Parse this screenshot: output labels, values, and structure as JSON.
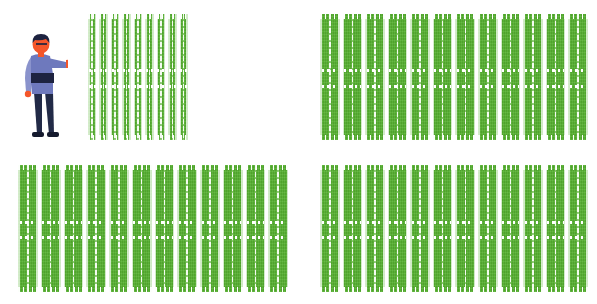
{
  "scene": {
    "title": "Array of football fields with a person for scale",
    "background_color": "#ffffff",
    "width": 597,
    "height": 304
  },
  "palette": {
    "field_green": "#55b02f",
    "field_green_dark": "#3f8f22",
    "line_white": "#f7fdf4",
    "skin": "#f4562a",
    "hair": "#1d2340",
    "shirt": "#6e79bd",
    "shirt_band": "#1d2340",
    "sleeve": "#8a93cc",
    "trousers": "#222a47",
    "shoes": "#151a2e"
  },
  "person": {
    "name": "person-figure",
    "pose": "standing, right arm extended pointing toward the fields",
    "caption": ""
  },
  "field_blocks": [
    {
      "name": "field-block-top-left",
      "position": "top-left",
      "strip_count": 9,
      "left": 88,
      "top": 14,
      "width": 100,
      "height": 126
    },
    {
      "name": "field-block-top-right",
      "position": "top-right",
      "strip_count": 12,
      "left": 320,
      "top": 14,
      "width": 268,
      "height": 126
    },
    {
      "name": "field-block-bottom-left",
      "position": "bottom-left",
      "strip_count": 12,
      "left": 18,
      "top": 165,
      "width": 270,
      "height": 127
    },
    {
      "name": "field-block-bottom-right",
      "position": "bottom-right",
      "strip_count": 12,
      "left": 320,
      "top": 165,
      "width": 268,
      "height": 127
    }
  ],
  "totals": {
    "block_count": 4,
    "strip_total": 45
  }
}
